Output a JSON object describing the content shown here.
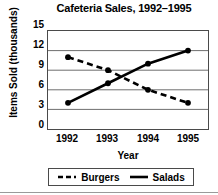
{
  "chart_data": {
    "type": "line",
    "title": "Cafeteria Sales, 1992–1995",
    "xlabel": "Year",
    "ylabel": "Items Sold (thousands)",
    "categories": [
      "1992",
      "1993",
      "1994",
      "1995"
    ],
    "yticks": [
      "15",
      "12",
      "9",
      "6",
      "3",
      "0"
    ],
    "ylim": [
      0,
      15
    ],
    "grid": true,
    "grid_axis": "y",
    "legend_position": "bottom",
    "series": [
      {
        "name": "Burgers",
        "style": "dashed",
        "marker": "circle",
        "color": "#000000",
        "values": [
          11,
          9,
          6,
          4
        ]
      },
      {
        "name": "Salads",
        "style": "solid",
        "marker": "circle",
        "color": "#000000",
        "values": [
          4,
          7,
          10,
          12
        ]
      }
    ]
  },
  "legend": {
    "burgers_label": "Burgers",
    "salads_label": "Salads"
  }
}
